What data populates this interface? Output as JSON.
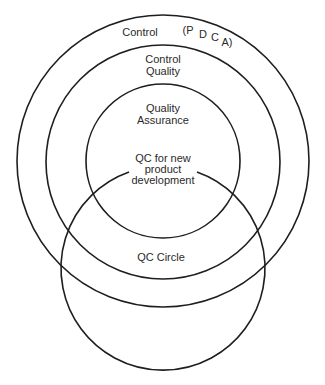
{
  "diagram": {
    "type": "nested-venn",
    "circles": [
      {
        "id": "control",
        "label": "Control",
        "annotation": [
          "(P",
          "D",
          "C",
          "A)"
        ],
        "cx": 163,
        "cy": 161,
        "r": 146
      },
      {
        "id": "control-quality",
        "label_lines": [
          "Control",
          "Quality"
        ],
        "cx": 163,
        "cy": 162,
        "r": 117
      },
      {
        "id": "quality-assurance",
        "label_lines": [
          "Quality",
          "Assurance"
        ],
        "cx": 163,
        "cy": 161,
        "r": 77
      },
      {
        "id": "qc-circle",
        "label": "QC Circle",
        "cx": 163,
        "cy": 268,
        "r": 102
      }
    ],
    "center_label_lines": [
      "QC for new",
      "product",
      "development"
    ]
  },
  "colors": {
    "stroke": "#1e1e1e",
    "text": "#2a2a2a",
    "background": "#ffffff"
  }
}
